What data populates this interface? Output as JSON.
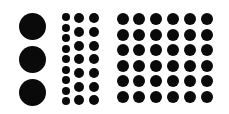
{
  "figure": {
    "background": "#ffffff",
    "dot_color": "#0a0a0a",
    "groups": [
      {
        "name": "large-column",
        "diameter": 27,
        "xs": [
          32
        ],
        "ys": [
          26,
          59,
          92
        ]
      },
      {
        "name": "small-column",
        "diameter": 8,
        "xs": [
          66
        ],
        "ys": [
          17,
          28,
          38,
          49,
          59,
          70,
          80,
          91,
          101
        ]
      },
      {
        "name": "medium-columns",
        "diameter": 10,
        "xs": [
          79,
          94
        ],
        "ys": [
          18,
          32,
          46,
          59,
          73,
          87,
          100
        ]
      },
      {
        "name": "grid-6x6",
        "diameter": 12,
        "xs": [
          123,
          139,
          156,
          173,
          190,
          207
        ],
        "ys": [
          19,
          35,
          50,
          66,
          81,
          97
        ]
      }
    ]
  }
}
